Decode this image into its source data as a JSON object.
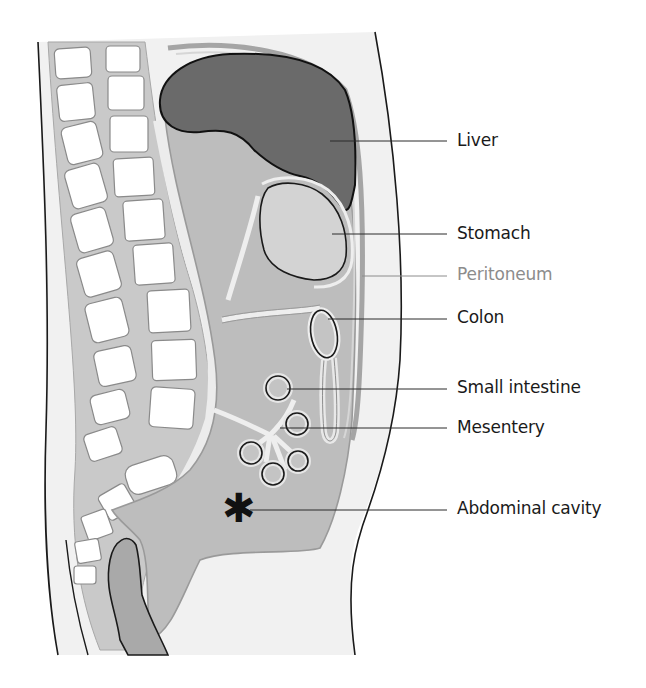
{
  "figure": {
    "colors": {
      "background": "#ffffff",
      "body_fill": "#f1f1f1",
      "tissue_fill": "#bdbdbd",
      "tissue_stroke": "#9a9a9a",
      "liver_fill": "#6a6a6a",
      "stomach_fill": "#cfcfcf",
      "bone_fill": "#ffffff",
      "outline": "#1a1a1a",
      "leader_line": "#2a2a2a",
      "peritoneum_label": "#8c8c8c"
    },
    "marker_symbol": "✱"
  },
  "labels": [
    {
      "id": "liver",
      "text": "Liver",
      "y": 130,
      "muted": false
    },
    {
      "id": "stomach",
      "text": "Stomach",
      "y": 220,
      "muted": false
    },
    {
      "id": "peritoneum",
      "text": "Peritoneum",
      "y": 261,
      "muted": true
    },
    {
      "id": "colon",
      "text": "Colon",
      "y": 304,
      "muted": false
    },
    {
      "id": "small-intestine",
      "text": "Small intestine",
      "y": 374,
      "muted": false
    },
    {
      "id": "mesentery",
      "text": "Mesentery",
      "y": 415,
      "muted": false
    },
    {
      "id": "abdominal-cavity",
      "text": "Abdominal cavity",
      "y": 497,
      "muted": false
    }
  ]
}
